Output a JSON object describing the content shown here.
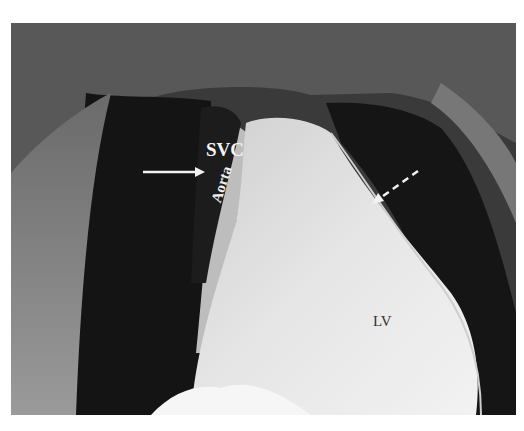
{
  "figure": {
    "type": "anatomical dissection photograph (grayscale)",
    "labels": {
      "svc": "SVC",
      "aorta": "Aorta",
      "lv": "LV"
    },
    "annotations": [
      {
        "kind": "solid-arrow",
        "pointing": "right",
        "target": "SVC region"
      },
      {
        "kind": "dashed-arrow",
        "pointing": "down-left",
        "target": "pericardial edge near LV"
      }
    ],
    "colors": {
      "background": "#ffffff",
      "dark_cavity": "#141414",
      "tissue_light": "#d8d8d8",
      "label_light": "#f4f4f4",
      "label_dark": "#333333"
    }
  }
}
